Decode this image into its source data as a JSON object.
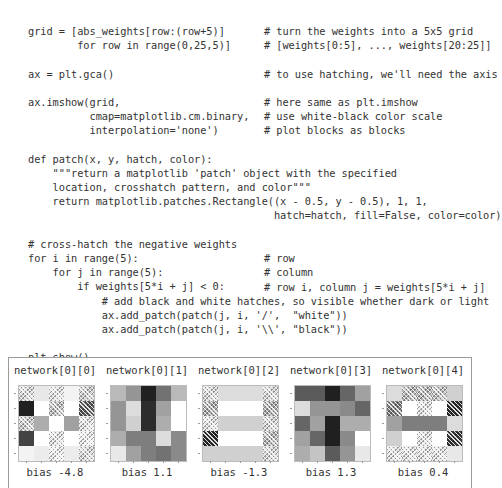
{
  "code": {
    "lines": [
      {
        "code": "grid = [abs_weights[row:(row+5)]",
        "comment": "# turn the weights into a 5x5 grid"
      },
      {
        "code": "        for row in range(0,25,5)]",
        "comment": "# [weights[0:5], ..., weights[20:25]]"
      },
      {
        "code": "",
        "comment": ""
      },
      {
        "code": "ax = plt.gca()",
        "comment": "# to use hatching, we'll need the axis"
      },
      {
        "code": "",
        "comment": ""
      },
      {
        "code": "ax.imshow(grid,",
        "comment": "# here same as plt.imshow"
      },
      {
        "code": "          cmap=matplotlib.cm.binary,",
        "comment": "# use white-black color scale"
      },
      {
        "code": "          interpolation='none')",
        "comment": "# plot blocks as blocks"
      },
      {
        "code": "",
        "comment": ""
      },
      {
        "code": "def patch(x, y, hatch, color):",
        "comment": ""
      },
      {
        "code": "    \"\"\"return a matplotlib 'patch' object with the specified",
        "comment": ""
      },
      {
        "code": "    location, crosshatch pattern, and color\"\"\"",
        "comment": ""
      },
      {
        "code": "    return matplotlib.patches.Rectangle((x - 0.5, y - 0.5), 1, 1,",
        "comment": ""
      },
      {
        "code": "                                        hatch=hatch, fill=False, color=color)",
        "comment": ""
      },
      {
        "code": "",
        "comment": ""
      },
      {
        "code": "# cross-hatch the negative weights",
        "comment": ""
      },
      {
        "code": "for i in range(5):",
        "comment": "# row"
      },
      {
        "code": "    for j in range(5):",
        "comment": "# column"
      },
      {
        "code": "        if weights[5*i + j] < 0:",
        "comment": "# row i, column j = weights[5*i + j]"
      },
      {
        "code": "            # add black and white hatches, so visible whether dark or light",
        "comment": ""
      },
      {
        "code": "            ax.add_patch(patch(j, i, '/',  \"white\"))",
        "comment": ""
      },
      {
        "code": "            ax.add_patch(patch(j, i, '\\\\', \"black\"))",
        "comment": ""
      },
      {
        "code": "",
        "comment": ""
      },
      {
        "code": "plt.show()",
        "comment": ""
      }
    ]
  },
  "figure": {
    "panels": [
      {
        "title": "network[0][0]",
        "bias": "bias -4.8"
      },
      {
        "title": "network[0][1]",
        "bias": "bias 1.1"
      },
      {
        "title": "network[0][2]",
        "bias": "bias -1.3"
      },
      {
        "title": "network[0][3]",
        "bias": "bias 1.3"
      },
      {
        "title": "network[0][4]",
        "bias": "bias 0.4"
      }
    ]
  },
  "chart_data": [
    {
      "type": "heatmap",
      "title": "network[0][0]",
      "xlabel": "bias -4.8",
      "cmap": "binary",
      "values": [
        [
          0.15,
          0.1,
          0.1,
          0.05,
          0.2
        ],
        [
          0.95,
          0.0,
          0.25,
          0.0,
          0.7
        ],
        [
          0.2,
          0.35,
          0.0,
          0.4,
          0.1
        ],
        [
          0.8,
          0.0,
          0.1,
          0.0,
          0.05
        ],
        [
          0.05,
          0.08,
          0.05,
          0.08,
          0.15
        ]
      ],
      "negative": [
        [
          1,
          0,
          1,
          0,
          1
        ],
        [
          0,
          0,
          1,
          0,
          1
        ],
        [
          1,
          0,
          0,
          0,
          1
        ],
        [
          0,
          0,
          1,
          0,
          1
        ],
        [
          0,
          0,
          1,
          0,
          1
        ]
      ]
    },
    {
      "type": "heatmap",
      "title": "network[0][1]",
      "xlabel": "bias 1.1",
      "cmap": "binary",
      "values": [
        [
          0.3,
          0.45,
          0.95,
          0.6,
          0.3
        ],
        [
          0.45,
          0.15,
          0.9,
          0.4,
          0.0
        ],
        [
          0.45,
          0.2,
          0.9,
          0.35,
          0.0
        ],
        [
          0.35,
          0.55,
          0.55,
          0.15,
          0.5
        ],
        [
          0.1,
          0.4,
          0.55,
          0.6,
          0.5
        ]
      ],
      "negative": [
        [
          0,
          0,
          0,
          0,
          0
        ],
        [
          0,
          0,
          0,
          0,
          0
        ],
        [
          0,
          0,
          0,
          0,
          0
        ],
        [
          0,
          0,
          0,
          0,
          0
        ],
        [
          0,
          0,
          0,
          0,
          0
        ]
      ]
    },
    {
      "type": "heatmap",
      "title": "network[0][2]",
      "xlabel": "bias -1.3",
      "cmap": "binary",
      "values": [
        [
          0.15,
          0.15,
          0.15,
          0.15,
          0.15
        ],
        [
          0.35,
          0.0,
          0.0,
          0.0,
          0.35
        ],
        [
          0.1,
          0.2,
          0.2,
          0.2,
          0.15
        ],
        [
          0.9,
          0.0,
          0.0,
          0.0,
          0.3
        ],
        [
          0.2,
          0.2,
          0.2,
          0.2,
          0.15
        ]
      ],
      "negative": [
        [
          1,
          0,
          0,
          0,
          1
        ],
        [
          1,
          0,
          0,
          0,
          1
        ],
        [
          1,
          0,
          0,
          0,
          1
        ],
        [
          1,
          0,
          0,
          0,
          1
        ],
        [
          0,
          0,
          0,
          0,
          1
        ]
      ]
    },
    {
      "type": "heatmap",
      "title": "network[0][3]",
      "xlabel": "bias 1.3",
      "cmap": "binary",
      "values": [
        [
          0.7,
          0.7,
          0.95,
          0.65,
          0.4
        ],
        [
          0.15,
          0.45,
          0.45,
          0.5,
          0.65
        ],
        [
          0.65,
          0.4,
          0.95,
          0.35,
          0.35
        ],
        [
          0.4,
          0.65,
          0.95,
          0.5,
          0.0
        ],
        [
          0.35,
          0.25,
          0.7,
          0.45,
          0.1
        ]
      ],
      "negative": [
        [
          0,
          0,
          0,
          0,
          0
        ],
        [
          0,
          0,
          0,
          0,
          0
        ],
        [
          0,
          0,
          0,
          0,
          0
        ],
        [
          0,
          0,
          0,
          0,
          0
        ],
        [
          0,
          0,
          0,
          0,
          0
        ]
      ]
    },
    {
      "type": "heatmap",
      "title": "network[0][4]",
      "xlabel": "bias 0.4",
      "cmap": "binary",
      "values": [
        [
          0.15,
          0.3,
          0.3,
          0.25,
          0.2
        ],
        [
          0.55,
          0.0,
          0.1,
          0.0,
          0.9
        ],
        [
          0.4,
          0.55,
          0.55,
          0.55,
          0.15
        ],
        [
          0.2,
          0.0,
          0.1,
          0.0,
          0.85
        ],
        [
          0.1,
          0.1,
          0.1,
          0.1,
          0.1
        ]
      ],
      "negative": [
        [
          0,
          1,
          1,
          1,
          0
        ],
        [
          1,
          0,
          1,
          0,
          1
        ],
        [
          0,
          0,
          0,
          0,
          0
        ],
        [
          0,
          0,
          1,
          0,
          1
        ],
        [
          1,
          1,
          1,
          1,
          0
        ]
      ]
    }
  ],
  "panel_left": [
    14,
    106,
    198,
    290,
    382
  ]
}
